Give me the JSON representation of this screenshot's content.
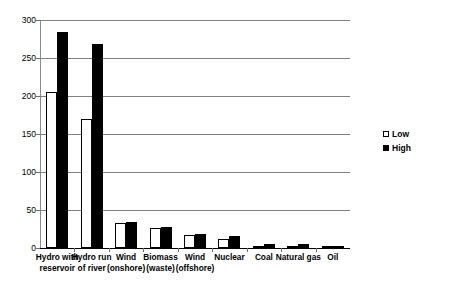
{
  "chart_data": {
    "type": "bar",
    "title": "",
    "subtitle": "",
    "xlabel": "",
    "ylabel": "",
    "ylim": [
      0,
      300
    ],
    "y_ticks": [
      0,
      50,
      100,
      150,
      200,
      250,
      300
    ],
    "grid": true,
    "legend_position": "right",
    "categories": [
      "Hydro with reservoir",
      "Hydro run of river",
      "Wind (onshore)",
      "Biomass (waste)",
      "Wind (offshore)",
      "Nuclear",
      "Coal",
      "Natural gas",
      "Oil"
    ],
    "category_lines": [
      [
        "Hydro with",
        "reservoir"
      ],
      [
        "Hydro run",
        "of river"
      ],
      [
        "Wind",
        "(onshore)"
      ],
      [
        "Biomass",
        "(waste)"
      ],
      [
        "Wind",
        "(offshore)"
      ],
      [
        "Nuclear",
        ""
      ],
      [
        "Coal",
        ""
      ],
      [
        "Natural gas",
        ""
      ],
      [
        "Oil",
        ""
      ]
    ],
    "series": [
      {
        "name": "Low",
        "color": "#ffffff",
        "values": [
          205,
          170,
          33,
          26,
          17,
          12,
          2,
          2,
          1
        ]
      },
      {
        "name": "High",
        "color": "#000000",
        "values": [
          284,
          268,
          34,
          27,
          19,
          16,
          5,
          5,
          3
        ]
      }
    ]
  },
  "legend": {
    "items": [
      {
        "label": "Low"
      },
      {
        "label": "High"
      }
    ]
  },
  "axis": {
    "y_tick_labels": [
      "300",
      "250",
      "200",
      "150",
      "100",
      "50",
      "0"
    ]
  }
}
